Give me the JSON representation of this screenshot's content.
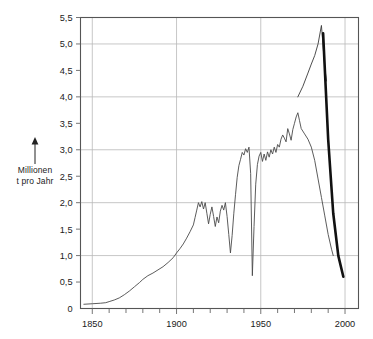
{
  "chart_data": {
    "type": "line",
    "title": "",
    "subtitle": "",
    "xlabel": "",
    "ylabel": "Millionen t pro Jahr",
    "ylabel_line1": "Millionen",
    "ylabel_line2": "t pro Jahr",
    "xlim": [
      1843,
      2008
    ],
    "ylim": [
      0,
      5.5
    ],
    "grid": true,
    "legend": "none",
    "y_ticks": [
      0,
      0.5,
      1.0,
      1.5,
      2.0,
      2.5,
      3.0,
      3.5,
      4.0,
      4.5,
      5.0,
      5.5
    ],
    "y_tick_labels": [
      "0",
      "0,5",
      "1,0",
      "1,5",
      "2,0",
      "2,5",
      "3,0",
      "3,5",
      "4,0",
      "4,5",
      "5,0",
      "5,5"
    ],
    "y_gridline_values": [
      3.0,
      4.0,
      5.0,
      1.0,
      2.0,
      5.5
    ],
    "x_ticks_major": [
      1850,
      1900,
      1950,
      2000
    ],
    "x_tick_labels": [
      "1850",
      "1900",
      "1950",
      "2000"
    ],
    "x_ticks_minor": [
      1860,
      1870,
      1880,
      1890,
      1910,
      1920,
      1930,
      1940,
      1960,
      1970,
      1980,
      1990
    ],
    "series": [
      {
        "name": "production-thin-line",
        "color": "#4a4a4a",
        "width": 0.9,
        "points": [
          [
            1845,
            0.08
          ],
          [
            1850,
            0.09
          ],
          [
            1855,
            0.1
          ],
          [
            1858,
            0.11
          ],
          [
            1860,
            0.13
          ],
          [
            1863,
            0.16
          ],
          [
            1866,
            0.2
          ],
          [
            1869,
            0.26
          ],
          [
            1872,
            0.33
          ],
          [
            1875,
            0.41
          ],
          [
            1878,
            0.49
          ],
          [
            1880,
            0.55
          ],
          [
            1883,
            0.62
          ],
          [
            1886,
            0.67
          ],
          [
            1889,
            0.73
          ],
          [
            1892,
            0.79
          ],
          [
            1895,
            0.87
          ],
          [
            1898,
            0.96
          ],
          [
            1900,
            1.05
          ],
          [
            1902,
            1.13
          ],
          [
            1904,
            1.22
          ],
          [
            1906,
            1.33
          ],
          [
            1908,
            1.45
          ],
          [
            1910,
            1.58
          ],
          [
            1911,
            1.72
          ],
          [
            1912,
            1.86
          ],
          [
            1913,
            2.0
          ],
          [
            1914,
            1.92
          ],
          [
            1915,
            2.02
          ],
          [
            1916,
            1.88
          ],
          [
            1917,
            2.0
          ],
          [
            1918,
            1.8
          ],
          [
            1919,
            1.6
          ],
          [
            1920,
            1.78
          ],
          [
            1921,
            1.92
          ],
          [
            1922,
            1.74
          ],
          [
            1923,
            1.55
          ],
          [
            1924,
            1.73
          ],
          [
            1925,
            1.62
          ],
          [
            1926,
            1.84
          ],
          [
            1927,
            1.95
          ],
          [
            1928,
            1.86
          ],
          [
            1929,
            2.0
          ],
          [
            1930,
            1.74
          ],
          [
            1931,
            1.4
          ],
          [
            1932,
            1.05
          ],
          [
            1933,
            1.38
          ],
          [
            1934,
            1.8
          ],
          [
            1935,
            2.15
          ],
          [
            1936,
            2.48
          ],
          [
            1937,
            2.7
          ],
          [
            1938,
            2.82
          ],
          [
            1939,
            2.95
          ],
          [
            1940,
            2.9
          ],
          [
            1941,
            3.02
          ],
          [
            1942,
            2.95
          ],
          [
            1943,
            3.05
          ],
          [
            1944,
            2.55
          ],
          [
            1945,
            0.62
          ],
          [
            1946,
            1.55
          ],
          [
            1947,
            2.35
          ],
          [
            1948,
            2.72
          ],
          [
            1949,
            2.88
          ],
          [
            1950,
            2.95
          ],
          [
            1951,
            2.78
          ],
          [
            1952,
            2.92
          ],
          [
            1953,
            2.8
          ],
          [
            1954,
            2.96
          ],
          [
            1955,
            2.86
          ],
          [
            1956,
            3.0
          ],
          [
            1957,
            2.92
          ],
          [
            1958,
            3.05
          ],
          [
            1959,
            2.95
          ],
          [
            1960,
            3.1
          ],
          [
            1961,
            3.05
          ],
          [
            1962,
            3.2
          ],
          [
            1963,
            3.28
          ],
          [
            1964,
            3.22
          ],
          [
            1965,
            3.15
          ],
          [
            1966,
            3.4
          ],
          [
            1967,
            3.3
          ],
          [
            1968,
            3.18
          ],
          [
            1969,
            3.38
          ],
          [
            1970,
            3.5
          ],
          [
            1971,
            3.62
          ],
          [
            1972,
            3.7
          ],
          [
            1973,
            3.55
          ],
          [
            1974,
            3.4
          ],
          [
            1976,
            3.3
          ],
          [
            1978,
            3.2
          ],
          [
            1980,
            3.05
          ],
          [
            1982,
            2.8
          ],
          [
            1984,
            2.45
          ],
          [
            1986,
            2.1
          ],
          [
            1988,
            1.75
          ],
          [
            1990,
            1.4
          ],
          [
            1992,
            1.12
          ],
          [
            1993,
            1.0
          ]
        ]
      },
      {
        "name": "peak-thin-line",
        "color": "#3a3a3a",
        "width": 0.9,
        "points": [
          [
            1972,
            4.0
          ],
          [
            1975,
            4.2
          ],
          [
            1978,
            4.45
          ],
          [
            1980,
            4.62
          ],
          [
            1982,
            4.78
          ],
          [
            1984,
            5.0
          ],
          [
            1986,
            5.35
          ],
          [
            1988,
            4.55
          ],
          [
            1989,
            4.3
          ]
        ]
      },
      {
        "name": "decline-thick-line",
        "color": "#111111",
        "width": 2.6,
        "points": [
          [
            1987,
            5.2
          ],
          [
            1990,
            3.2
          ],
          [
            1993,
            1.8
          ],
          [
            1996,
            1.0
          ],
          [
            1999,
            0.6
          ]
        ]
      }
    ]
  },
  "axis": {
    "arrow_icon": "up-arrow"
  }
}
